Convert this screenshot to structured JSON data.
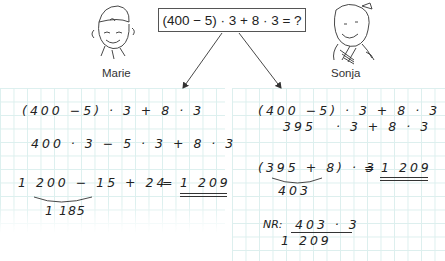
{
  "task": {
    "expression": "(400 − 5) · 3 + 8 · 3 = ?"
  },
  "characters": [
    {
      "name": "Marie",
      "icon": "girl-with-cap-illustration"
    },
    {
      "name": "Sonja",
      "icon": "girl-with-bow-illustration"
    }
  ],
  "marie_solution": {
    "line1": "(400 −5) · 3 + 8 · 3",
    "line2": "400 · 3 − 5 · 3 + 8 · 3",
    "line3_left": "1 200 − 15 + 24",
    "line3_eq": "=",
    "result": "1 209",
    "subresult": "1 185"
  },
  "sonja_solution": {
    "line1": "(400 −5) · 3 + 8 · 3",
    "line2_a": "395",
    "line2_b": "· 3 + 8 · 3",
    "line3_left": "(395 + 8) · 3",
    "line3_eq": "=",
    "result": "1 209",
    "subresult": "403",
    "nr_label": "NR:",
    "nr_expr": "403 · 3",
    "nr_result": "1 209"
  },
  "colors": {
    "grid": "#dcefee",
    "ink": "#222222"
  }
}
